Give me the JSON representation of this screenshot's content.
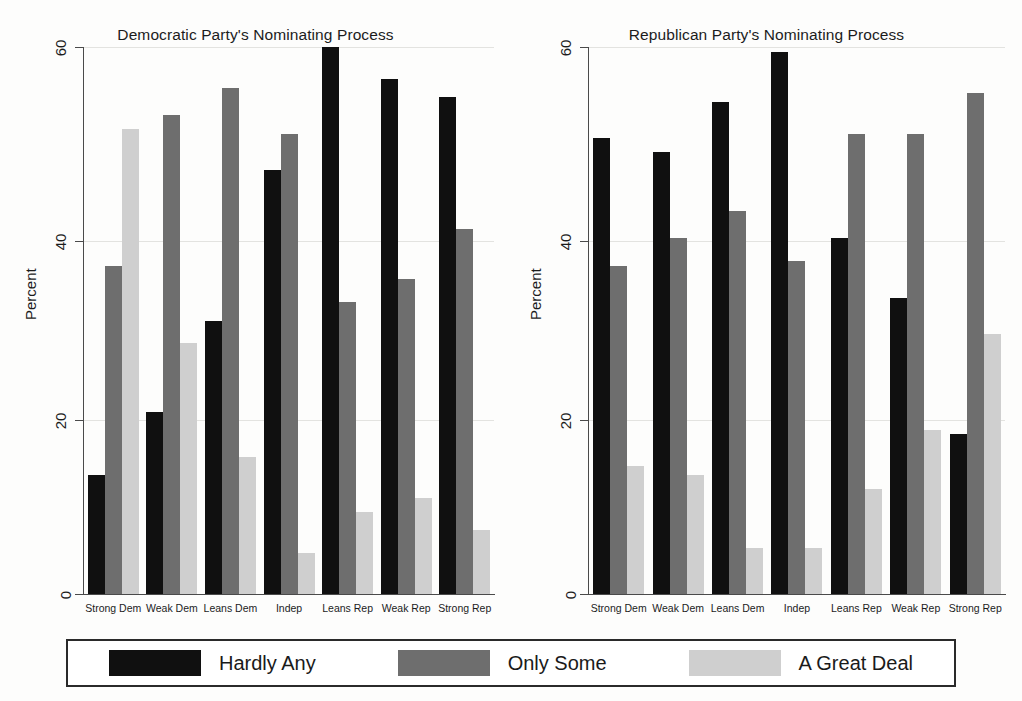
{
  "chart_data": [
    {
      "type": "bar",
      "title": "Democratic Party's Nominating Process",
      "xlabel": "",
      "ylabel": "Percent",
      "ylim": [
        0,
        60
      ],
      "yticks": [
        0,
        20,
        40,
        60
      ],
      "grid": true,
      "legend_position": "bottom",
      "categories": [
        "Strong Dem",
        "Weak Dem",
        "Leans Dem",
        "Indep",
        "Leans Rep",
        "Weak Rep",
        "Strong Rep"
      ],
      "series": [
        {
          "name": "Hardly Any",
          "color": "#101010",
          "values": [
            13,
            20,
            30,
            46.5,
            60,
            56.5,
            54.5
          ]
        },
        {
          "name": "Only Some",
          "color": "#6e6e6e",
          "values": [
            36,
            52.5,
            55.5,
            50.5,
            32,
            34.5,
            40
          ]
        },
        {
          "name": "A Great Deal",
          "color": "#cfcfcf",
          "values": [
            51,
            27.5,
            15,
            4.5,
            9,
            10.5,
            7
          ]
        }
      ]
    },
    {
      "type": "bar",
      "title": "Republican Party's Nominating Process",
      "xlabel": "",
      "ylabel": "Percent",
      "ylim": [
        0,
        60
      ],
      "yticks": [
        0,
        20,
        40,
        60
      ],
      "grid": true,
      "legend_position": "bottom",
      "categories": [
        "Strong Dem",
        "Weak Dem",
        "Leans Dem",
        "Indep",
        "Leans Rep",
        "Weak Rep",
        "Strong Rep"
      ],
      "series": [
        {
          "name": "Hardly Any",
          "color": "#101010",
          "values": [
            50,
            48.5,
            54,
            59.5,
            39,
            32.5,
            17.5
          ]
        },
        {
          "name": "Only Some",
          "color": "#6e6e6e",
          "values": [
            36,
            39,
            42,
            36.5,
            50.5,
            50.5,
            55
          ]
        },
        {
          "name": "A Great Deal",
          "color": "#cfcfcf",
          "values": [
            14,
            13,
            5,
            5,
            11.5,
            18,
            28.5
          ]
        }
      ]
    }
  ],
  "panels": [
    {
      "title": "Democratic Party's Nominating Process",
      "ylabel": "Percent",
      "yticks": [
        "60",
        "40",
        "20",
        "0"
      ],
      "xticks": [
        "Strong Dem",
        "Weak Dem",
        "Leans Dem",
        "Indep",
        "Leans Rep",
        "Weak Rep",
        "Strong Rep"
      ]
    },
    {
      "title": "Republican Party's Nominating Process",
      "ylabel": "Percent",
      "yticks": [
        "60",
        "40",
        "20",
        "0"
      ],
      "xticks": [
        "Strong Dem",
        "Weak Dem",
        "Leans Dem",
        "Indep",
        "Leans Rep",
        "Weak Rep",
        "Strong Rep"
      ]
    }
  ],
  "legend": {
    "items": [
      {
        "label": "Hardly Any",
        "color": "#101010"
      },
      {
        "label": "Only Some",
        "color": "#6e6e6e"
      },
      {
        "label": "A Great Deal",
        "color": "#cfcfcf"
      }
    ]
  }
}
